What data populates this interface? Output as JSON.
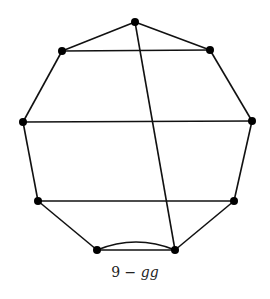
{
  "figure": {
    "caption_number": "9",
    "caption_dash": " − ",
    "caption_label": "gg",
    "nodes": [
      {
        "id": "top",
        "x": 135,
        "y": 22
      },
      {
        "id": "upper-left",
        "x": 62,
        "y": 51
      },
      {
        "id": "upper-right",
        "x": 210,
        "y": 50
      },
      {
        "id": "mid-left",
        "x": 23,
        "y": 122
      },
      {
        "id": "mid-right",
        "x": 252,
        "y": 121
      },
      {
        "id": "lower-left",
        "x": 38,
        "y": 201
      },
      {
        "id": "lower-right",
        "x": 234,
        "y": 201
      },
      {
        "id": "bottom-left",
        "x": 97,
        "y": 250
      },
      {
        "id": "bottom-right",
        "x": 175,
        "y": 250
      }
    ],
    "edges": [
      [
        "top",
        "upper-left"
      ],
      [
        "top",
        "upper-right"
      ],
      [
        "upper-left",
        "upper-right"
      ],
      [
        "upper-left",
        "mid-left"
      ],
      [
        "upper-right",
        "mid-right"
      ],
      [
        "mid-left",
        "mid-right"
      ],
      [
        "mid-left",
        "lower-left"
      ],
      [
        "mid-right",
        "lower-right"
      ],
      [
        "lower-left",
        "lower-right"
      ],
      [
        "lower-left",
        "bottom-left"
      ],
      [
        "lower-right",
        "bottom-right"
      ],
      [
        "bottom-left",
        "bottom-right"
      ],
      [
        "top",
        "bottom-right"
      ]
    ],
    "curved_edges": [
      [
        "bottom-left",
        "bottom-right"
      ]
    ]
  }
}
